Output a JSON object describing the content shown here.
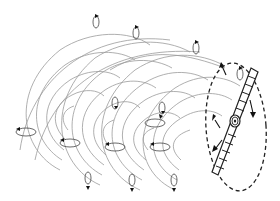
{
  "diagram": {
    "elements": {
      "wake_spirals": 4,
      "rotation_markers": 14,
      "rotor_disk": "dashed ellipse",
      "blade": "hatched twisted blade through hub",
      "hub": "spiral hub at disk center"
    },
    "colors": {
      "wake_lines": "#9a9a9a",
      "ink": "#222222",
      "background": "#ffffff"
    }
  }
}
